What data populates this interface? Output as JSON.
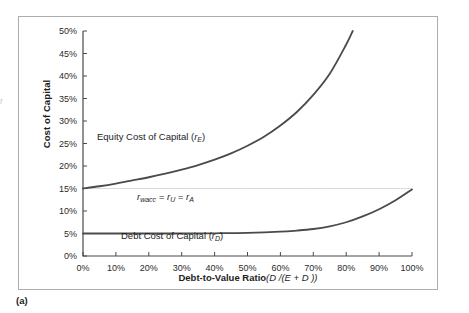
{
  "figure": {
    "caption": "(a)",
    "margin_fragment": "r"
  },
  "chart_data": {
    "type": "line",
    "title": "",
    "xlabel_plain": "Debt-to-Value Ratio",
    "xlabel_math": "(D /(E + D ))",
    "ylabel": "Cost of Capital",
    "xlim": [
      0,
      100
    ],
    "ylim": [
      0,
      50
    ],
    "grid": false,
    "legend_position": "inline-annotations",
    "x_tick_labels": [
      "0%",
      "10%",
      "20%",
      "30%",
      "40%",
      "50%",
      "60%",
      "70%",
      "80%",
      "90%",
      "100%"
    ],
    "x_tick_values": [
      0,
      10,
      20,
      30,
      40,
      50,
      60,
      70,
      80,
      90,
      100
    ],
    "y_tick_labels": [
      "0%",
      "5%",
      "10%",
      "15%",
      "20%",
      "25%",
      "30%",
      "35%",
      "40%",
      "45%",
      "50%"
    ],
    "y_tick_values": [
      0,
      5,
      10,
      15,
      20,
      25,
      30,
      35,
      40,
      45,
      50
    ],
    "annotations": [
      {
        "id": "equity",
        "text_plain": "Equity Cost of Capital (",
        "symbol": "r",
        "subscript": "E",
        "text_close": ")"
      },
      {
        "id": "wacc",
        "text": "r_wacc = r_U = r_A",
        "symbol1": "r",
        "sub1": "wacc",
        "symbol2": "r",
        "sub2": "U",
        "symbol3": "r",
        "sub3": "A",
        "eq": "="
      },
      {
        "id": "debt",
        "text_plain": "Debt Cost of Capital (",
        "symbol": "r",
        "subscript": "D",
        "text_close": ")"
      }
    ],
    "series": [
      {
        "name": "Equity Cost of Capital (rE)",
        "color": "#4a4a4a",
        "x": [
          0,
          5,
          10,
          15,
          20,
          25,
          30,
          35,
          40,
          45,
          50,
          55,
          60,
          65,
          70,
          75,
          80,
          82
        ],
        "values": [
          15.0,
          15.5,
          16.1,
          16.8,
          17.5,
          18.3,
          19.2,
          20.2,
          21.4,
          22.8,
          24.5,
          26.5,
          29.0,
          32.0,
          35.8,
          40.5,
          47.0,
          50.0
        ]
      },
      {
        "name": "Debt Cost of Capital (rD)",
        "color": "#4a4a4a",
        "x": [
          0,
          10,
          20,
          30,
          40,
          50,
          60,
          65,
          70,
          75,
          80,
          85,
          90,
          95,
          100
        ],
        "values": [
          5.0,
          5.0,
          5.0,
          5.0,
          5.05,
          5.15,
          5.4,
          5.65,
          6.0,
          6.6,
          7.5,
          8.8,
          10.4,
          12.4,
          14.8
        ]
      },
      {
        "name": "r_wacc = r_U = r_A",
        "color": "#d9dadc",
        "x": [
          0,
          100
        ],
        "values": [
          15.0,
          15.0
        ]
      }
    ]
  }
}
